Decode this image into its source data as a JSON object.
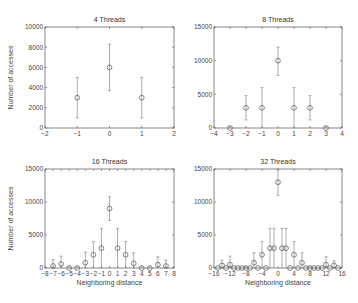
{
  "chart_data": [
    {
      "type": "scatter",
      "title": "4 Threads",
      "xlabel": "",
      "ylabel": "Number of accesses",
      "xlim": [
        -2,
        2
      ],
      "ylim": [
        0,
        10000
      ],
      "xticks": [
        -2,
        -1,
        0,
        1,
        2
      ],
      "yticks": [
        0,
        2000,
        4000,
        6000,
        8000,
        10000
      ],
      "grid": false,
      "box": {
        "x": 45,
        "y": 27,
        "w": 129,
        "h": 101
      },
      "x": [
        -1,
        0,
        1
      ],
      "values": [
        3000,
        6000,
        3000
      ],
      "err_low": [
        1000,
        3700,
        1000
      ],
      "err_high": [
        5000,
        8300,
        5000
      ]
    },
    {
      "type": "scatter",
      "title": "8 Threads",
      "xlabel": "",
      "ylabel": "",
      "xlim": [
        -4,
        4
      ],
      "ylim": [
        0,
        15000
      ],
      "xticks": [
        -4,
        -3,
        -2,
        -1,
        0,
        1,
        2,
        3,
        4
      ],
      "yticks": [
        0,
        5000,
        10000,
        15000
      ],
      "grid": false,
      "box": {
        "x": 214,
        "y": 27,
        "w": 128,
        "h": 101
      },
      "x": [
        -3,
        -2,
        -1,
        0,
        1,
        2,
        3
      ],
      "values": [
        0,
        3000,
        3000,
        10000,
        3000,
        3000,
        0
      ],
      "err_low": [
        0,
        1200,
        0,
        7800,
        0,
        1200,
        0
      ],
      "err_high": [
        0,
        4800,
        6000,
        12000,
        6000,
        4800,
        0
      ]
    },
    {
      "type": "scatter",
      "title": "16 Threads",
      "xlabel": "Neighboring distance",
      "ylabel": "Number of accesses",
      "xlim": [
        -8,
        8
      ],
      "ylim": [
        0,
        15000
      ],
      "xticks": [
        -8,
        -7,
        -6,
        -5,
        -4,
        -3,
        -2,
        -1,
        0,
        1,
        2,
        3,
        4,
        5,
        6,
        7,
        8
      ],
      "yticks": [
        0,
        5000,
        10000,
        15000
      ],
      "grid": false,
      "box": {
        "x": 45,
        "y": 169,
        "w": 129,
        "h": 99
      },
      "x": [
        -7,
        -6,
        -5,
        -4,
        -3,
        -2,
        -1,
        0,
        1,
        2,
        3,
        4,
        5,
        6,
        7
      ],
      "values": [
        300,
        600,
        0,
        0,
        800,
        2000,
        3000,
        9000,
        3000,
        2000,
        700,
        0,
        0,
        500,
        300
      ],
      "err_low": [
        0,
        0,
        0,
        0,
        0,
        0,
        0,
        7200,
        0,
        0,
        0,
        0,
        0,
        0,
        0
      ],
      "err_high": [
        1300,
        1800,
        0,
        0,
        2400,
        4000,
        6000,
        10800,
        6000,
        4000,
        2300,
        0,
        0,
        1700,
        1200
      ]
    },
    {
      "type": "scatter",
      "title": "32 Threads",
      "xlabel": "Neighboring distance",
      "ylabel": "",
      "xlim": [
        -16,
        16
      ],
      "ylim": [
        0,
        15000
      ],
      "xticks": [
        -16,
        -12,
        -8,
        -4,
        0,
        4,
        8,
        12,
        16
      ],
      "yticks": [
        0,
        5000,
        10000,
        15000
      ],
      "grid": false,
      "box": {
        "x": 214,
        "y": 169,
        "w": 128,
        "h": 99
      },
      "x": [
        -15,
        -14,
        -13,
        -12,
        -11,
        -10,
        -9,
        -8,
        -7,
        -6,
        -5,
        -4,
        -3,
        -2,
        -1,
        0,
        1,
        2,
        3,
        4,
        5,
        6,
        7,
        8,
        9,
        10,
        11,
        12,
        13,
        14,
        15
      ],
      "values": [
        0,
        400,
        0,
        500,
        0,
        0,
        0,
        0,
        0,
        800,
        0,
        2000,
        0,
        3000,
        3000,
        13000,
        3000,
        3000,
        0,
        2000,
        0,
        800,
        0,
        0,
        0,
        0,
        0,
        500,
        0,
        400,
        0
      ],
      "err_low": [
        0,
        0,
        0,
        0,
        0,
        0,
        0,
        0,
        0,
        0,
        0,
        0,
        0,
        0,
        0,
        11000,
        0,
        0,
        0,
        0,
        0,
        0,
        0,
        0,
        0,
        0,
        0,
        0,
        0,
        0,
        0
      ],
      "err_high": [
        0,
        1200,
        0,
        1800,
        0,
        0,
        0,
        0,
        0,
        2300,
        0,
        4000,
        0,
        6000,
        6000,
        15000,
        6000,
        6000,
        0,
        4000,
        0,
        2300,
        0,
        0,
        0,
        0,
        0,
        1700,
        0,
        1100,
        0
      ]
    }
  ]
}
